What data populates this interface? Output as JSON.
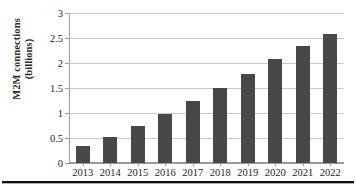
{
  "chart_data": {
    "type": "bar",
    "title": "",
    "xlabel": "",
    "ylabel": "M2M connections (billions)",
    "ylabel_lines": [
      "M2M connections",
      "(billions)"
    ],
    "categories": [
      "2013",
      "2014",
      "2015",
      "2016",
      "2017",
      "2018",
      "2019",
      "2020",
      "2021",
      "2022"
    ],
    "values": [
      0.35,
      0.53,
      0.75,
      0.99,
      1.24,
      1.51,
      1.79,
      2.08,
      2.35,
      2.59
    ],
    "series": [
      {
        "name": "M2M connections",
        "values": [
          0.35,
          0.53,
          0.75,
          0.99,
          1.24,
          1.51,
          1.79,
          2.08,
          2.35,
          2.59
        ]
      }
    ],
    "ylim": [
      0,
      3
    ],
    "ytick_labels": [
      "0",
      "0.5",
      "1",
      "1.5",
      "2",
      "2.5",
      "3"
    ],
    "ytick_values": [
      0,
      0.5,
      1,
      1.5,
      2,
      2.5,
      3
    ],
    "grid": true,
    "grid_axis": "y",
    "legend": false,
    "legend_position": "none",
    "bar_color": "#484848",
    "gridline_color": "#c9c9c9",
    "axis_color": "#9a9a9a",
    "background_color": "#ffffff"
  },
  "page": {
    "rule_color": "#111111"
  }
}
